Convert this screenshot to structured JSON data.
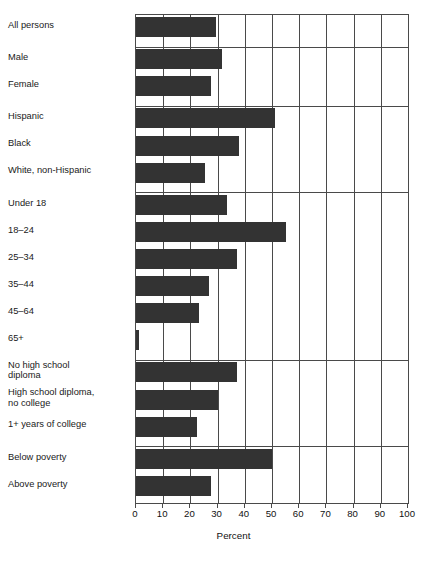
{
  "chart_data": {
    "type": "bar",
    "orientation": "horizontal",
    "title": "",
    "xlabel": "Percent",
    "ylabel": "",
    "xlim": [
      0,
      100
    ],
    "xticks": [
      0,
      10,
      20,
      30,
      40,
      50,
      60,
      70,
      80,
      90,
      100
    ],
    "xticklabels": [
      "0",
      "10",
      "20",
      "30",
      "40",
      "50",
      "60",
      "70",
      "80",
      "90",
      "100"
    ],
    "grid": "vertical",
    "legend": "none",
    "bar_color": "#333333",
    "axis_color": "#4a4a4a",
    "categories": [
      "All persons",
      "Male",
      "Female",
      "Hispanic",
      "Black",
      "White, non-Hispanic",
      "Under 18",
      "18–24",
      "25–34",
      "35–44",
      "45–64",
      "65+",
      "No high school\ndiploma",
      "High school diploma,\nno college",
      "1+ years of college",
      "Below poverty",
      "Above poverty"
    ],
    "values": [
      29.5,
      31.5,
      27.5,
      51,
      38,
      25.5,
      33.5,
      55,
      37,
      27,
      23,
      1,
      37,
      30,
      22.5,
      50,
      27.5
    ],
    "groups": [
      {
        "name": "total",
        "categories": [
          "All persons"
        ]
      },
      {
        "name": "sex",
        "categories": [
          "Male",
          "Female"
        ]
      },
      {
        "name": "race-ethnicity",
        "categories": [
          "Hispanic",
          "Black",
          "White, non-Hispanic"
        ]
      },
      {
        "name": "age",
        "categories": [
          "Under 18",
          "18–24",
          "25–34",
          "35–44",
          "45–64",
          "65+"
        ]
      },
      {
        "name": "education",
        "categories": [
          "No high school\ndiploma",
          "High school diploma,\nno college",
          "1+ years of college"
        ]
      },
      {
        "name": "poverty",
        "categories": [
          "Below poverty",
          "Above poverty"
        ]
      }
    ]
  }
}
